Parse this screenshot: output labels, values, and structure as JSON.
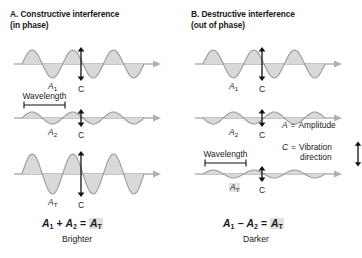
{
  "figure": {
    "type": "diagram",
    "background": "#ffffff",
    "wave_fill": "#d9d9d9",
    "wave_stroke": "#9a9a9a",
    "axis_color": "#b0b0b0",
    "arrow_color": "#111111",
    "text_color": "#1a1a1a",
    "highlight": "#e0e0e0"
  },
  "panels": [
    {
      "id": "a",
      "heading_line1": "A. Constructive interference",
      "heading_line2": "(in phase)",
      "rows": [
        {
          "amplitude_label": "A",
          "amplitude_sub": "1",
          "c_label": "C",
          "wavelength_label": null,
          "amp_px": 14,
          "wavelength_px": 41,
          "phase": "in",
          "highlight": false
        },
        {
          "amplitude_label": "A",
          "amplitude_sub": "2",
          "c_label": "C",
          "wavelength_label": "Wavelength",
          "amp_px": 6,
          "wavelength_px": 41,
          "phase": "in",
          "highlight": false
        },
        {
          "amplitude_label": "A",
          "amplitude_sub": "T",
          "c_label": "C",
          "wavelength_label": null,
          "amp_px": 20,
          "wavelength_px": 41,
          "phase": "in",
          "highlight": false
        }
      ],
      "equation": {
        "a": "A",
        "a_sub": "1",
        "op": "+",
        "b": "A",
        "b_sub": "2",
        "eq": "=",
        "result": "A",
        "result_sub": "T"
      },
      "equation_caption": "Brighter"
    },
    {
      "id": "b",
      "heading_line1": "B. Destructive interference",
      "heading_line2": "(out of phase)",
      "rows": [
        {
          "amplitude_label": "A",
          "amplitude_sub": "1",
          "c_label": "C",
          "wavelength_label": null,
          "amp_px": 14,
          "wavelength_px": 41,
          "phase": "in",
          "highlight": false
        },
        {
          "amplitude_label": "A",
          "amplitude_sub": "2",
          "c_label": "C",
          "wavelength_label": null,
          "amp_px": 6,
          "wavelength_px": 41,
          "phase": "out",
          "highlight": false
        },
        {
          "amplitude_label": "A",
          "amplitude_sub": "T",
          "c_label": "C",
          "wavelength_label": "Wavelength",
          "amp_px": 4,
          "wavelength_px": 41,
          "phase": "in",
          "highlight": true
        }
      ],
      "equation": {
        "a": "A",
        "a_sub": "1",
        "op": "−",
        "b": "A",
        "b_sub": "2",
        "eq": "=",
        "result": "A",
        "result_sub": "T"
      },
      "equation_caption": "Darker"
    }
  ],
  "legend": {
    "amplitude": {
      "symbol": "A",
      "equals": "=",
      "text": "Amplitude"
    },
    "vibration": {
      "symbol": "C",
      "equals": "=",
      "text_line1": "Vibration",
      "text_line2": "direction"
    }
  }
}
